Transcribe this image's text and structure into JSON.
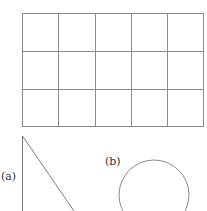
{
  "grid": {
    "rows": 3,
    "cols": 5,
    "x": 22,
    "y": 13,
    "width": 182,
    "height": 114,
    "line_color": "#8a8a8a"
  },
  "figures": [
    {
      "id": "a",
      "label": "(a)",
      "shape": "right-triangle"
    },
    {
      "id": "b",
      "label": "(b)",
      "shape": "circle"
    }
  ],
  "colors": {
    "stroke": "#7a7a7a",
    "text": "#333333"
  }
}
